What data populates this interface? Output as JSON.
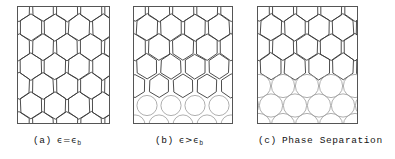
{
  "figure": {
    "type": "diagram",
    "panel_count": 3
  },
  "panels": [
    {
      "id": "panel-a",
      "tag": "(a)",
      "condition_symbol": "ϵ=ϵ",
      "condition_subscript": "b",
      "caption_plain": "(a)  ϵ=ϵb",
      "state": "uniform-hexagonal-honeycomb",
      "x": 17,
      "y": 6,
      "width": 93,
      "height": 118,
      "cell_shape_top": "hexagon",
      "cell_shape_bottom": "hexagon",
      "rows": 5,
      "columns": 4,
      "cell_width": 24,
      "cell_height": 26,
      "circle_fraction": 0.0
    },
    {
      "id": "panel-b",
      "tag": "(b)",
      "condition_symbol": "ϵ>ϵ",
      "condition_subscript": "b",
      "caption_plain": "(b)  ϵ>ϵb",
      "state": "gradual-transition-hexagon-to-separated-circles",
      "x": 133,
      "y": 6,
      "width": 100,
      "height": 118,
      "cell_shape_top": "hexagon",
      "cell_shape_bottom": "circle",
      "rows": 5,
      "columns": 4,
      "cell_width": 24,
      "cell_height": 26,
      "circle_fraction": 0.45,
      "circles_touching": false
    },
    {
      "id": "panel-c",
      "tag": "(c)",
      "condition_symbol": "Phase Separation",
      "condition_subscript": "",
      "caption_plain": "(c)  Phase Separation",
      "state": "sharp-interface-hexagons-over-packed-circles",
      "x": 257,
      "y": 6,
      "width": 101,
      "height": 118,
      "cell_shape_top": "hexagon",
      "cell_shape_bottom": "circle",
      "rows": 5,
      "columns": 4,
      "cell_width": 24,
      "cell_height": 26,
      "circle_fraction": 0.3,
      "circles_touching": true
    }
  ],
  "captions": [
    {
      "id": "caption-a",
      "tag": "(a)",
      "symbol": "ϵ=ϵ",
      "sub": "b",
      "x": 33,
      "y": 136
    },
    {
      "id": "caption-b",
      "tag": "(b)",
      "symbol": "ϵ>ϵ",
      "sub": "b",
      "x": 155,
      "y": 136
    },
    {
      "id": "caption-c",
      "tag": "(c)",
      "symbol": "Phase Separation",
      "sub": "",
      "x": 258,
      "y": 136
    }
  ],
  "colors": {
    "background": "#ffffff",
    "panel_border": "#555555",
    "cell_line": "#3a3a3a",
    "cell_line_light": "#9a9a9a",
    "caption_text": "#141414"
  }
}
